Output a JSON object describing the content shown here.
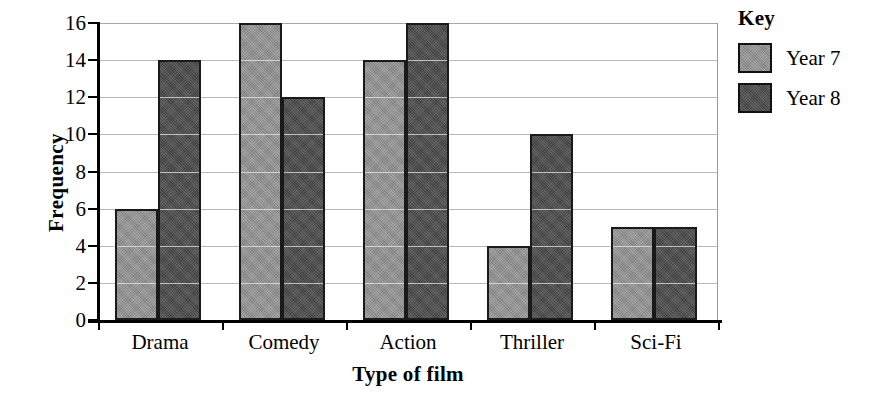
{
  "chart_data": {
    "type": "bar",
    "title": "",
    "xlabel": "Type of film",
    "ylabel": "Frequency",
    "categories": [
      "Drama",
      "Comedy",
      "Action",
      "Thriller",
      "Sci-Fi"
    ],
    "series": [
      {
        "name": "Year 7",
        "values": [
          6,
          16,
          14,
          4,
          5
        ],
        "color": "#8c8c8c"
      },
      {
        "name": "Year 8",
        "values": [
          14,
          12,
          16,
          10,
          5
        ],
        "color": "#484848"
      }
    ],
    "ylim": [
      0,
      16
    ],
    "ytick_labels": [
      "0",
      "2",
      "4",
      "6",
      "8",
      "10",
      "12",
      "14",
      "16"
    ],
    "ytick_values": [
      0,
      2,
      4,
      6,
      8,
      10,
      12,
      14,
      16
    ],
    "grid": true,
    "legend_position": "right"
  },
  "legend": {
    "title": "Key",
    "entries": [
      {
        "label": "Year 7"
      },
      {
        "label": "Year 8"
      }
    ]
  }
}
